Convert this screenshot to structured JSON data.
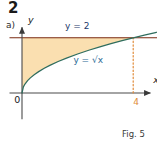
{
  "exercise": {
    "number": "2",
    "part": "a)"
  },
  "caption": {
    "text": "Fig. 5"
  },
  "chart_data": {
    "type": "area",
    "title": "",
    "subtitle": "",
    "xlabel": "x",
    "ylabel": "y",
    "xlim": [
      -0.45,
      5.2
    ],
    "ylim": [
      -0.95,
      2.6
    ],
    "grid": false,
    "legend": "none",
    "annotations": [
      {
        "name": "horizontal-line-label",
        "text": "y = 2",
        "x": 1.55,
        "y": 2.32,
        "color": "#1b3a6b"
      },
      {
        "name": "curve-label",
        "text": "y = √x",
        "x": 1.85,
        "y": 1.08,
        "color": "#2d6b96"
      },
      {
        "name": "origin-label",
        "text": "0",
        "x": -0.28,
        "y": -0.38,
        "color": "#1a1a1a"
      },
      {
        "name": "x-axis-label",
        "text": "x",
        "x": 4.72,
        "y": 0.36,
        "color": "#1a1a1a"
      },
      {
        "name": "y-axis-label",
        "text": "y",
        "x": 0.22,
        "y": 2.52,
        "color": "#1a1a1a"
      },
      {
        "name": "x-intercept-tick-label",
        "text": "4",
        "x": 4.0,
        "y": -0.42,
        "color": "#e08a38"
      }
    ],
    "series": [
      {
        "name": "y = √x",
        "type": "line",
        "color": "#2f6d5e",
        "x": [
          0,
          0.05,
          0.1,
          0.2,
          0.3,
          0.45,
          0.6,
          0.8,
          1.0,
          1.3,
          1.6,
          2.0,
          2.4,
          2.8,
          3.2,
          3.6,
          4.0,
          4.4,
          4.8,
          5.1
        ],
        "y": [
          0,
          0.2236,
          0.3162,
          0.4472,
          0.5477,
          0.6708,
          0.7746,
          0.8944,
          1.0,
          1.1402,
          1.2649,
          1.4142,
          1.5492,
          1.6733,
          1.7889,
          1.8974,
          2.0,
          2.0976,
          2.1909,
          2.2583
        ]
      },
      {
        "name": "y = 2",
        "type": "line",
        "color": "#7a2a12",
        "x": [
          -0.45,
          5.2
        ],
        "y": [
          2,
          2
        ]
      }
    ],
    "shaded_region": {
      "name": "area-between-y2-and-sqrtx",
      "description": "Region bounded above by y = 2, below by y = √x, from x = 0 to x = 4",
      "fill": "#fadfb0",
      "x_from": 0,
      "x_to": 4
    },
    "dashed_guide": {
      "name": "x-equals-4-dotted-line",
      "x": 4,
      "y_from": 0,
      "y_to": 2,
      "color": "#e08a38",
      "style": "dotted"
    },
    "axes": {
      "x_axis_color": "#4a4a4a",
      "y_axis_color": "#4a4a4a",
      "x_axis_y": 0,
      "y_axis_x": 0
    }
  },
  "colors": {
    "fill": "#fadfb0",
    "curve": "#2f6d5e",
    "horizontal_line": "#7a2a12",
    "dotted": "#e08a38",
    "axis": "#4a4a4a",
    "label_blue": "#1b3a6b",
    "label_teal": "#2d6b96",
    "tick_orange": "#e08a38",
    "text_dark": "#1a1a1a"
  }
}
